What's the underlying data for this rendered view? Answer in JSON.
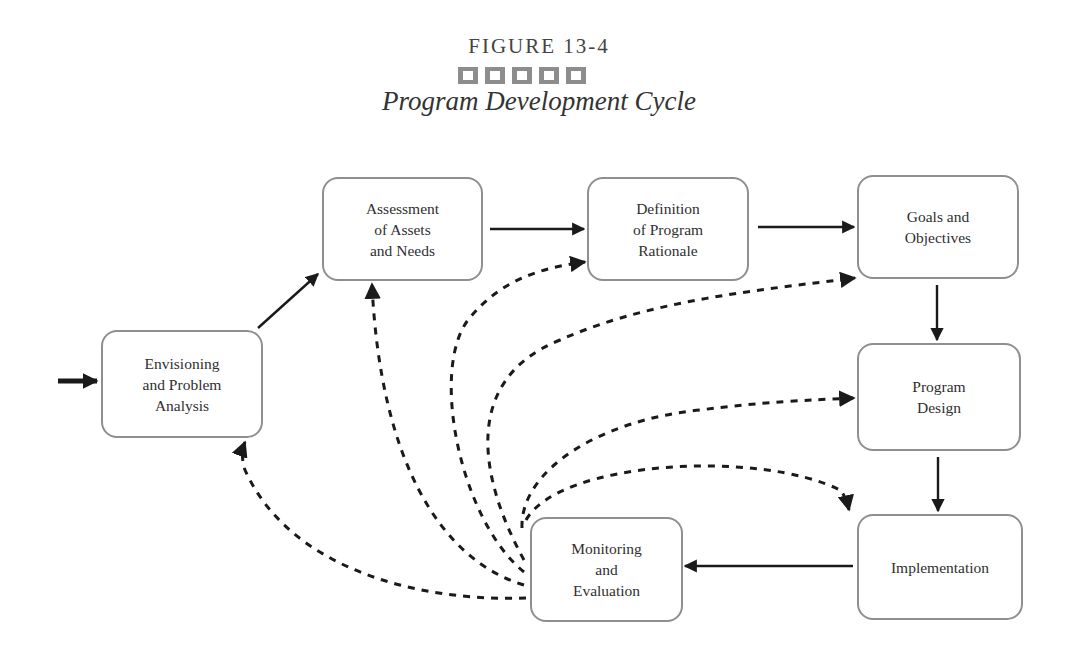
{
  "figure": {
    "label": "FIGURE 13-4",
    "title": "Program Development Cycle",
    "decorative_squares": 5
  },
  "nodes": [
    {
      "id": "envisioning",
      "label": "Envisioning\nand Problem\nAnalysis"
    },
    {
      "id": "assessment",
      "label": "Assessment\nof Assets\nand Needs"
    },
    {
      "id": "definition",
      "label": "Definition\nof Program\nRationale"
    },
    {
      "id": "goals",
      "label": "Goals and\nObjectives"
    },
    {
      "id": "design",
      "label": "Program\nDesign"
    },
    {
      "id": "implementation",
      "label": "Implementation"
    },
    {
      "id": "monitoring",
      "label": "Monitoring\nand\nEvaluation"
    }
  ],
  "edges": {
    "solid": [
      {
        "from": "entry",
        "to": "envisioning"
      },
      {
        "from": "envisioning",
        "to": "assessment"
      },
      {
        "from": "assessment",
        "to": "definition"
      },
      {
        "from": "definition",
        "to": "goals"
      },
      {
        "from": "goals",
        "to": "design"
      },
      {
        "from": "design",
        "to": "implementation"
      },
      {
        "from": "implementation",
        "to": "monitoring"
      }
    ],
    "dashed_feedback": [
      {
        "from": "monitoring",
        "to": "envisioning"
      },
      {
        "from": "monitoring",
        "to": "assessment"
      },
      {
        "from": "monitoring",
        "to": "definition"
      },
      {
        "from": "monitoring",
        "to": "goals"
      },
      {
        "from": "monitoring",
        "to": "design"
      },
      {
        "from": "monitoring",
        "to": "implementation"
      }
    ]
  },
  "colors": {
    "box_border": "#8f8f8f",
    "arrow": "#1a1a1a",
    "squares": "#8d8d8d"
  }
}
